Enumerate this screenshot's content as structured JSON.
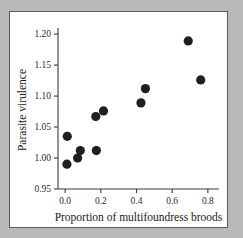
{
  "figure": {
    "panel_background": "#ffffff",
    "page_background": "#b9b9b9",
    "border_color": "#5c5c5c"
  },
  "chart_data": {
    "type": "scatter",
    "title": "",
    "xlabel": "Proportion of multifoundress broods",
    "ylabel": "Parasite virulence",
    "xlim": [
      -0.04,
      0.84
    ],
    "ylim": [
      0.95,
      1.205
    ],
    "xticks": [
      0.0,
      0.2,
      0.4,
      0.6,
      0.8
    ],
    "xticklabels": [
      "0.0",
      "0.2",
      "0.4",
      "0.6",
      "0.8"
    ],
    "yticks": [
      0.95,
      1.0,
      1.05,
      1.1,
      1.15,
      1.2
    ],
    "yticklabels": [
      "0.95",
      "1.00",
      "1.05",
      "1.10",
      "1.15",
      "1.20"
    ],
    "grid": false,
    "legend": null,
    "marker": {
      "shape": "circle",
      "color": "#1f1f1f",
      "size": 4.6
    },
    "n_points": 11,
    "x": [
      0.01,
      0.012,
      0.07,
      0.085,
      0.175,
      0.172,
      0.215,
      0.425,
      0.45,
      0.69,
      0.76
    ],
    "y": [
      0.99,
      1.035,
      1.0,
      1.012,
      1.012,
      1.067,
      1.076,
      1.089,
      1.112,
      1.189,
      1.126
    ],
    "points": [
      {
        "x": 0.01,
        "y": 0.99
      },
      {
        "x": 0.012,
        "y": 1.035
      },
      {
        "x": 0.07,
        "y": 1.0
      },
      {
        "x": 0.085,
        "y": 1.012
      },
      {
        "x": 0.175,
        "y": 1.012
      },
      {
        "x": 0.172,
        "y": 1.067
      },
      {
        "x": 0.215,
        "y": 1.076
      },
      {
        "x": 0.425,
        "y": 1.089
      },
      {
        "x": 0.45,
        "y": 1.112
      },
      {
        "x": 0.69,
        "y": 1.189
      },
      {
        "x": 0.76,
        "y": 1.126
      }
    ]
  }
}
